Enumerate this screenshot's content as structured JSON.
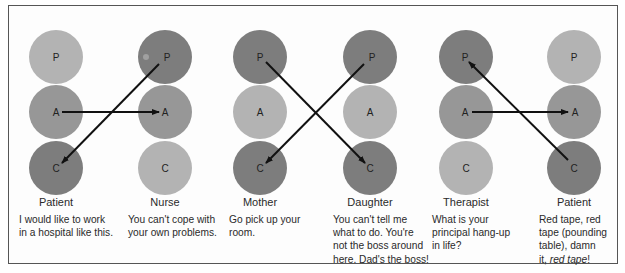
{
  "figure": {
    "colors": {
      "dark": "#7d7d7d",
      "medium": "#979797",
      "light": "#b3b3b3",
      "arrow": "#111111",
      "border": "#555555"
    },
    "transactions": [
      {
        "id": "patient-nurse",
        "left": {
          "role": "Patient",
          "caption": "I would like to work\nin a hospital like this.",
          "states": [
            {
              "letter": "P",
              "shade": "light"
            },
            {
              "letter": "A",
              "shade": "medium"
            },
            {
              "letter": "C",
              "shade": "dark"
            }
          ]
        },
        "right": {
          "role": "Nurse",
          "caption": "You can't cope with\nyour own problems.",
          "states": [
            {
              "letter": "P",
              "shade": "dark"
            },
            {
              "letter": "A",
              "shade": "medium"
            },
            {
              "letter": "C",
              "shade": "light"
            }
          ]
        },
        "arrows": [
          {
            "from": "Patient A",
            "to": "Nurse A"
          },
          {
            "from": "Nurse P",
            "to": "Patient C"
          }
        ]
      },
      {
        "id": "mother-daughter",
        "left": {
          "role": "Mother",
          "caption": "Go pick up your\nroom.",
          "states": [
            {
              "letter": "P",
              "shade": "dark"
            },
            {
              "letter": "A",
              "shade": "light"
            },
            {
              "letter": "C",
              "shade": "dark"
            }
          ]
        },
        "right": {
          "role": "Daughter",
          "caption": "You can't tell me\nwhat to do. You're\nnot the boss around\nhere. Dad's the boss!",
          "states": [
            {
              "letter": "P",
              "shade": "dark"
            },
            {
              "letter": "A",
              "shade": "light"
            },
            {
              "letter": "C",
              "shade": "dark"
            }
          ]
        },
        "arrows": [
          {
            "from": "Mother P",
            "to": "Daughter C"
          },
          {
            "from": "Daughter P",
            "to": "Mother C"
          }
        ]
      },
      {
        "id": "therapist-patient",
        "left": {
          "role": "Therapist",
          "caption": "What is your\nprincipal  hang-up\nin life?",
          "states": [
            {
              "letter": "P",
              "shade": "dark"
            },
            {
              "letter": "A",
              "shade": "medium"
            },
            {
              "letter": "C",
              "shade": "light"
            }
          ]
        },
        "right": {
          "role": "Patient",
          "caption_parts": [
            "Red tape, red\ntape (pounding\ntable), damn\n it, ",
            "red tape",
            "!"
          ],
          "states": [
            {
              "letter": "P",
              "shade": "light"
            },
            {
              "letter": "A",
              "shade": "medium"
            },
            {
              "letter": "C",
              "shade": "dark"
            }
          ]
        },
        "arrows": [
          {
            "from": "Therapist A",
            "to": "Patient A"
          },
          {
            "from": "Patient C",
            "to": "Therapist P"
          }
        ]
      }
    ]
  }
}
